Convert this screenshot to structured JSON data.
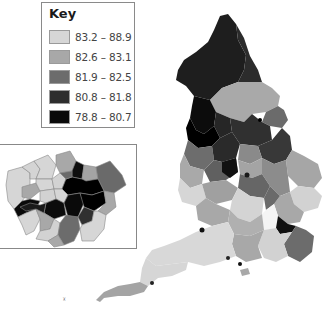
{
  "key": {
    "title": "Key",
    "items": [
      {
        "label": "83.2 – 88.9",
        "color": "#d6d6d6"
      },
      {
        "label": "82.6 – 83.1",
        "color": "#a8a8a8"
      },
      {
        "label": "81.9 – 82.5",
        "color": "#6c6c6c"
      },
      {
        "label": "80.8 – 81.8",
        "color": "#2e2e2e"
      },
      {
        "label": "78.8 – 80.7",
        "color": "#0a0a0a"
      }
    ]
  },
  "map": {
    "region": "England",
    "inset": "London",
    "border_color": "#888888",
    "highest_color": "#f4f4f4"
  }
}
